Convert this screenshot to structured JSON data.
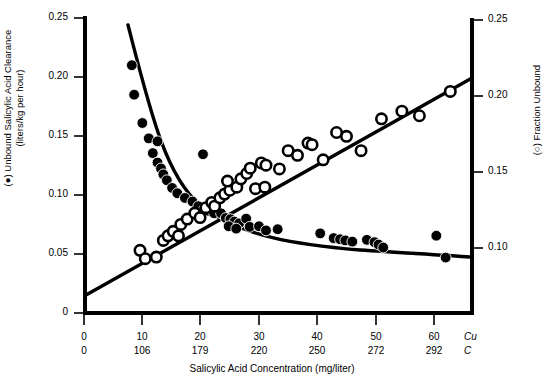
{
  "chart_data": {
    "type": "scatter",
    "title": "",
    "xlabel": "Salicylic Acid Concentration (mg/liter)",
    "xlim": [
      0,
      67
    ],
    "grid": false,
    "legend_position": "none",
    "x_axis": {
      "label": "Salicylic Acid Concentration (mg/liter)",
      "rows": [
        {
          "tag": "Cu",
          "ticks": [
            "0",
            "10",
            "20",
            "30",
            "40",
            "50",
            "60"
          ],
          "values": [
            0,
            10,
            20,
            30,
            40,
            50,
            60
          ]
        },
        {
          "tag": "C",
          "ticks": [
            "0",
            "106",
            "179",
            "220",
            "250",
            "272",
            "292"
          ],
          "values": [
            0,
            106,
            179,
            220,
            250,
            272,
            292
          ]
        }
      ]
    },
    "y_axis_left": {
      "label_line1": "(●) Unbound Salicylic Acid Clearance",
      "label_line2": "(liters/kg per hour)",
      "ticks": [
        "0.25",
        "0.20",
        "0.15",
        "0.10",
        "0.05",
        "0"
      ],
      "values": [
        0.25,
        0.2,
        0.15,
        0.1,
        0.05,
        0
      ],
      "ylim": [
        0,
        0.25
      ],
      "marker": "filled-circle"
    },
    "y_axis_right": {
      "label": "(○) Fraction Unbound",
      "ticks": [
        "0.25",
        "0.20",
        "0.15",
        "0.10"
      ],
      "values": [
        0.25,
        0.2,
        0.15,
        0.1
      ],
      "ylim": [
        0.0836,
        0.25
      ],
      "marker": "open-circle"
    },
    "series": [
      {
        "name": "Unbound Salicylic Acid Clearance",
        "marker": "filled-circle",
        "axis": "left",
        "color": "#000000",
        "points": [
          [
            8.2,
            0.21
          ],
          [
            8.6,
            0.185
          ],
          [
            10.0,
            0.161
          ],
          [
            11.1,
            0.148
          ],
          [
            12.6,
            0.1455
          ],
          [
            11.8,
            0.1355
          ],
          [
            12.6,
            0.1275
          ],
          [
            13.2,
            0.1225
          ],
          [
            13.6,
            0.1175
          ],
          [
            14.2,
            0.1125
          ],
          [
            15.1,
            0.106
          ],
          [
            16.0,
            0.1015
          ],
          [
            20.4,
            0.1345
          ],
          [
            17.3,
            0.0975
          ],
          [
            18.6,
            0.0945
          ],
          [
            19.6,
            0.0905
          ],
          [
            20.6,
            0.088
          ],
          [
            21.4,
            0.0865
          ],
          [
            22.3,
            0.0845
          ],
          [
            23.5,
            0.0845
          ],
          [
            24.3,
            0.0805
          ],
          [
            25.1,
            0.0795
          ],
          [
            25.8,
            0.0775
          ],
          [
            26.6,
            0.076
          ],
          [
            27.8,
            0.08
          ],
          [
            24.8,
            0.0735
          ],
          [
            26.1,
            0.0715
          ],
          [
            28.4,
            0.073
          ],
          [
            30.0,
            0.0735
          ],
          [
            31.2,
            0.07
          ],
          [
            33.2,
            0.071
          ],
          [
            40.5,
            0.0675
          ],
          [
            42.8,
            0.0635
          ],
          [
            43.9,
            0.0625
          ],
          [
            44.8,
            0.0615
          ],
          [
            46.0,
            0.0605
          ],
          [
            48.5,
            0.062
          ],
          [
            49.8,
            0.06
          ],
          [
            50.5,
            0.058
          ],
          [
            51.3,
            0.0555
          ],
          [
            60.4,
            0.0655
          ],
          [
            62.0,
            0.047
          ]
        ],
        "fit_curve": "hyperbolic decay"
      },
      {
        "name": "Fraction Unbound",
        "marker": "open-circle",
        "axis": "right",
        "color": "#000000",
        "points": [
          [
            9.6,
            0.0985
          ],
          [
            10.5,
            0.093
          ],
          [
            12.4,
            0.094
          ],
          [
            13.6,
            0.105
          ],
          [
            14.4,
            0.108
          ],
          [
            15.3,
            0.111
          ],
          [
            16.6,
            0.1155
          ],
          [
            16.2,
            0.108
          ],
          [
            17.7,
            0.119
          ],
          [
            19.0,
            0.123
          ],
          [
            19.9,
            0.12
          ],
          [
            20.9,
            0.1265
          ],
          [
            21.9,
            0.13
          ],
          [
            22.4,
            0.1275
          ],
          [
            23.3,
            0.133
          ],
          [
            24.1,
            0.1355
          ],
          [
            25.0,
            0.138
          ],
          [
            24.6,
            0.144
          ],
          [
            26.2,
            0.14
          ],
          [
            26.9,
            0.1455
          ],
          [
            27.9,
            0.149
          ],
          [
            28.5,
            0.1525
          ],
          [
            29.4,
            0.139
          ],
          [
            30.4,
            0.156
          ],
          [
            31.2,
            0.1545
          ],
          [
            31.0,
            0.14
          ],
          [
            33.5,
            0.152
          ],
          [
            35.0,
            0.164
          ],
          [
            36.6,
            0.161
          ],
          [
            38.4,
            0.169
          ],
          [
            39.1,
            0.168
          ],
          [
            41.0,
            0.158
          ],
          [
            43.3,
            0.176
          ],
          [
            45.0,
            0.1735
          ],
          [
            47.5,
            0.164
          ],
          [
            51.0,
            0.185
          ],
          [
            54.5,
            0.19
          ],
          [
            57.5,
            0.187
          ],
          [
            62.8,
            0.203
          ]
        ],
        "fit_curve": "linear rising"
      }
    ]
  },
  "caption": {
    "partial_text": ""
  }
}
